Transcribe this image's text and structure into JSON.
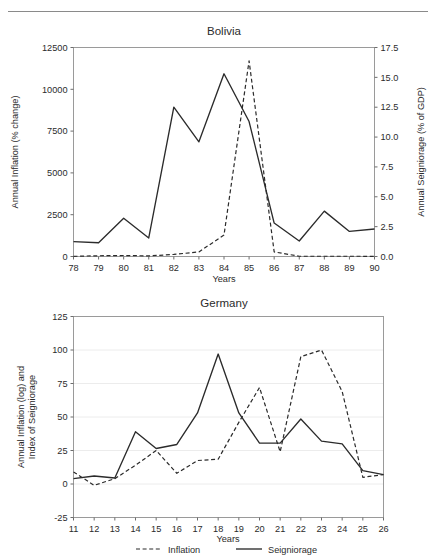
{
  "page": {
    "top_rule": "horizontal-rule"
  },
  "chart_data": [
    {
      "id": "bolivia",
      "type": "line",
      "title": "Bolivia",
      "xlabel": "Years",
      "ylabel": "Annual Inflation (% change)",
      "ylabel_right": "Annual Seigniorage (% of GDP)",
      "grid": false,
      "legend": "none",
      "x": [
        78,
        79,
        80,
        81,
        82,
        83,
        84,
        85,
        86,
        87,
        88,
        89,
        90
      ],
      "xticks": [
        "78",
        "79",
        "80",
        "81",
        "82",
        "83",
        "84",
        "85",
        "86",
        "87",
        "88",
        "89",
        "90"
      ],
      "ylim": [
        0,
        12500
      ],
      "yticks": [
        "0",
        "2500",
        "5000",
        "7500",
        "10000",
        "12500"
      ],
      "ytickvals": [
        0,
        2500,
        5000,
        7500,
        10000,
        12500
      ],
      "ylim_right": [
        0.0,
        17.5
      ],
      "yticks_right": [
        "0.0",
        "2.5",
        "5.0",
        "7.5",
        "10.0",
        "12.5",
        "15.0",
        "17.5"
      ],
      "ytickvals_right": [
        0,
        2.5,
        5,
        7.5,
        10,
        12.5,
        15,
        17.5
      ],
      "series": [
        {
          "name": "Seigniorage",
          "style": "solid",
          "axis": "right",
          "values": [
            1.25,
            1.15,
            3.2,
            1.55,
            12.5,
            9.6,
            15.3,
            11.3,
            2.8,
            1.3,
            3.8,
            2.1,
            2.3
          ]
        },
        {
          "name": "Inflation",
          "style": "dashed",
          "axis": "left",
          "values": [
            10,
            45,
            60,
            35,
            125,
            275,
            1280,
            11700,
            275,
            15,
            16,
            15,
            12
          ]
        }
      ]
    },
    {
      "id": "germany",
      "type": "line",
      "title": "Germany",
      "xlabel": "Years",
      "ylabel": "Annual Inflation (log) and\nIndex of Seigniorage",
      "ylabel_line1": "Annual Inflation (log) and",
      "ylabel_line2": "Index of Seigniorage",
      "grid": true,
      "legend": "bottom",
      "x": [
        11,
        12,
        13,
        14,
        15,
        16,
        17,
        18,
        19,
        20,
        21,
        22,
        23,
        24,
        25,
        26
      ],
      "xticks": [
        "11",
        "12",
        "13",
        "14",
        "15",
        "16",
        "17",
        "18",
        "19",
        "20",
        "21",
        "22",
        "23",
        "24",
        "25",
        "26"
      ],
      "ylim": [
        -25,
        125
      ],
      "yticks": [
        "-25",
        "0",
        "25",
        "50",
        "75",
        "100",
        "125"
      ],
      "ytickvals": [
        -25,
        0,
        25,
        50,
        75,
        100,
        125
      ],
      "series": [
        {
          "name": "Seigniorage",
          "style": "solid",
          "values": [
            4,
            6,
            4.5,
            39,
            26.5,
            29.5,
            53,
            97,
            53,
            30.5,
            30.5,
            48.5,
            32,
            30,
            10,
            7
          ]
        },
        {
          "name": "Inflation",
          "style": "dashed",
          "values": [
            9,
            -1,
            4,
            14,
            25,
            8,
            17.5,
            18.5,
            46,
            72,
            24,
            95,
            100,
            69,
            5,
            7
          ]
        }
      ],
      "legend_items": [
        {
          "label": "Inflation",
          "style": "dashed"
        },
        {
          "label": "Seigniorage",
          "style": "solid"
        }
      ]
    }
  ]
}
